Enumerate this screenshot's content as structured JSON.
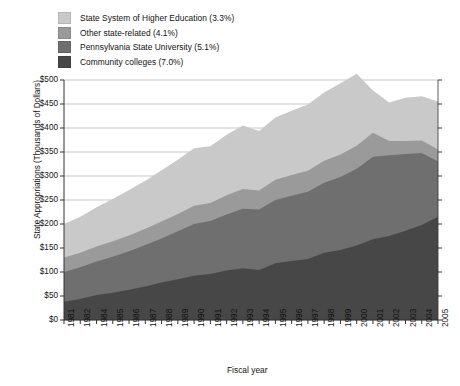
{
  "legend": {
    "items": [
      {
        "label": "State System of Higher Education (3.3%)",
        "color": "#c9c9c9",
        "key": "state_system"
      },
      {
        "label": "Other state-related (4.1%)",
        "color": "#9a9a9a",
        "key": "other_state_related"
      },
      {
        "label": "Pennsylvania State University (5.1%)",
        "color": "#6f6f6f",
        "key": "penn_state"
      },
      {
        "label": "Community colleges (7.0%)",
        "color": "#474747",
        "key": "community_colleges"
      }
    ]
  },
  "axes": {
    "ylabel": "State Appropriations (Thousands of Dollars)",
    "xlabel": "Fiscal year",
    "yticks": [
      "$0",
      "$50",
      "$100",
      "$150",
      "$200",
      "$250",
      "$300",
      "$350",
      "$400",
      "$450",
      "$500"
    ]
  },
  "chart_data": {
    "type": "area",
    "title": "",
    "xlabel": "Fiscal year",
    "ylabel": "State Appropriations (Thousands of Dollars)",
    "ylim": [
      0,
      500
    ],
    "ytick_step": 50,
    "grid": true,
    "stacked": true,
    "legend_position": "top-left",
    "categories": [
      "1981",
      "1982",
      "1984",
      "1985",
      "1986",
      "1987",
      "1988",
      "1989",
      "1990",
      "1991",
      "1992",
      "1993",
      "1994",
      "1995",
      "1996",
      "1997",
      "1998",
      "1999",
      "2000",
      "2001",
      "2002",
      "2003",
      "2004",
      "2005"
    ],
    "series": [
      {
        "name": "Community colleges (7.0%)",
        "color": "#474747",
        "values": [
          38,
          44,
          52,
          57,
          63,
          70,
          78,
          85,
          92,
          96,
          103,
          108,
          104,
          118,
          123,
          127,
          140,
          146,
          155,
          168,
          175,
          186,
          198,
          215
        ]
      },
      {
        "name": "Pennsylvania State University (5.1%)",
        "color": "#6f6f6f",
        "values": [
          62,
          66,
          70,
          75,
          80,
          86,
          92,
          100,
          108,
          110,
          117,
          124,
          126,
          132,
          136,
          140,
          146,
          152,
          160,
          172,
          168,
          160,
          150,
          115
        ]
      },
      {
        "name": "Other state-related (4.1%)",
        "color": "#9a9a9a",
        "values": [
          30,
          30,
          31,
          32,
          33,
          34,
          35,
          36,
          38,
          38,
          40,
          41,
          40,
          42,
          43,
          44,
          46,
          47,
          48,
          50,
          30,
          27,
          26,
          25
        ]
      },
      {
        "name": "State System of Higher Education (3.3%)",
        "color": "#c9c9c9",
        "values": [
          70,
          75,
          82,
          88,
          95,
          100,
          107,
          113,
          120,
          118,
          126,
          132,
          124,
          130,
          134,
          138,
          142,
          148,
          150,
          88,
          80,
          90,
          92,
          100
        ]
      }
    ],
    "totals": [
      200,
      215,
      235,
      252,
      271,
      290,
      312,
      334,
      358,
      362,
      386,
      405,
      394,
      422,
      436,
      449,
      474,
      493,
      513,
      478,
      453,
      463,
      466,
      455
    ]
  },
  "caption": {
    "text": ""
  }
}
